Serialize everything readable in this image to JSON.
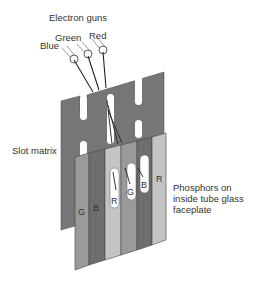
{
  "diagram": {
    "title_label": "Electron guns",
    "guns": [
      {
        "label": "Blue",
        "name": "blue"
      },
      {
        "label": "Green",
        "name": "green"
      },
      {
        "label": "Red",
        "name": "red"
      }
    ],
    "slot_matrix_label": "Slot matrix",
    "phosphor_label_lines": [
      "Phosphors on",
      "inside tube glass",
      "faceplate"
    ],
    "stripes": [
      {
        "letter": "G",
        "color": "#9a9a9a"
      },
      {
        "letter": "B",
        "color": "#6e6e6e"
      },
      {
        "letter": "R",
        "color": "#c4c4c4"
      },
      {
        "letter": "G",
        "color": "#9a9a9a"
      },
      {
        "letter": "B",
        "color": "#6e6e6e"
      },
      {
        "letter": "R",
        "color": "#c4c4c4"
      }
    ],
    "colors": {
      "slot_matrix": "#767676",
      "outline": "#444444",
      "wire": "#222222"
    }
  }
}
